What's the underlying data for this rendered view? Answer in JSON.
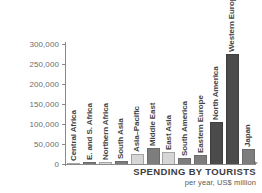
{
  "chart_data": {
    "type": "bar",
    "title": "SPENDING BY TOURISTS",
    "subtitle": "per year, US$ million",
    "xlabel": "",
    "ylabel": "",
    "ylim": [
      0,
      300000
    ],
    "grid": false,
    "legend": "none",
    "ytick_labels": [
      "300,000",
      "250,000",
      "200,000",
      "150,000",
      "100,000",
      "50,000",
      "0"
    ],
    "ytick_values": [
      300000,
      250000,
      200000,
      150000,
      100000,
      50000,
      0
    ],
    "categories": [
      "Central Africa",
      "E. and S. Africa",
      "Northern Africa",
      "South Asia",
      "Asia–Pacific",
      "Middle East",
      "East Asia",
      "South America",
      "Eastern Europe",
      "North America",
      "Western Europe",
      "Japan"
    ],
    "values": [
      2000,
      6000,
      5500,
      8000,
      26000,
      40000,
      29000,
      16000,
      22000,
      105000,
      275000,
      37000
    ],
    "bar_shades": [
      "light",
      "mid",
      "light",
      "mid",
      "light",
      "mid",
      "light",
      "mid",
      "mid",
      "dark",
      "dark",
      "mid"
    ],
    "colors": {
      "light": "#d6d6d6",
      "mid": "#7d7d7d",
      "dark": "#4b4b4b",
      "axis": "#8a8a8a",
      "text": "#444444"
    }
  }
}
